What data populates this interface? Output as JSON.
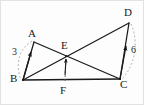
{
  "figure": {
    "background_color": "#fdfdfd",
    "border_color": "#e2e2e2",
    "stroke_color": "#1a1a1a",
    "dash_color": "#9a9a9a",
    "points": {
      "A": {
        "label": "A",
        "x": 33,
        "y": 41,
        "label_x": 27,
        "label_y": 27
      },
      "B": {
        "label": "B",
        "x": 22,
        "y": 79,
        "label_x": 10,
        "label_y": 73
      },
      "C": {
        "label": "C",
        "x": 119,
        "y": 78,
        "label_x": 119,
        "label_y": 79
      },
      "D": {
        "label": "D",
        "x": 128,
        "y": 22,
        "label_x": 123,
        "label_y": 7
      },
      "E": {
        "label": "E",
        "x": 65,
        "y": 55,
        "label_x": 59,
        "label_y": 40
      },
      "F": {
        "label": "F",
        "x": 64,
        "y": 78,
        "label_x": 59,
        "label_y": 85
      }
    },
    "segments": [
      {
        "name": "segment-AB",
        "from": "A",
        "to": "B"
      },
      {
        "name": "segment-AC",
        "from": "A",
        "to": "C"
      },
      {
        "name": "segment-BD",
        "from": "B",
        "to": "D"
      },
      {
        "name": "segment-DC",
        "from": "D",
        "to": "C"
      },
      {
        "name": "segment-BC",
        "from": "B",
        "to": "C"
      }
    ],
    "measures": {
      "left": {
        "value": "3",
        "x": 12,
        "y": 47,
        "vector": "B-to-A"
      },
      "right": {
        "value": "6",
        "x": 130,
        "y": 45,
        "vector": "C-to-D"
      }
    },
    "arrows": [
      {
        "name": "vector-BA",
        "note": "arrow from B toward A"
      },
      {
        "name": "vector-CD",
        "note": "arrow from C toward D"
      },
      {
        "name": "vector-FE",
        "note": "dashed arrow from F toward E"
      }
    ]
  }
}
